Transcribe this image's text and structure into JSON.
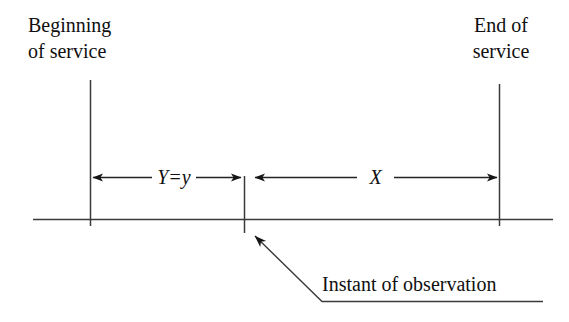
{
  "figure": {
    "title_left": {
      "line1": "Beginning",
      "line2": "of service"
    },
    "title_right": {
      "line1": "End of",
      "line2": "service"
    },
    "dimensions": [
      {
        "id": "y-interval",
        "label": "Y=y",
        "label_parts": {
          "variable": "Y",
          "equals": "=",
          "value": "y"
        }
      },
      {
        "id": "x-interval",
        "label": "X"
      }
    ],
    "annotation": {
      "text": "Instant of observation"
    },
    "colors": {
      "background": "#ffffff",
      "ink": "#101010",
      "line": "#3a3a3a"
    }
  }
}
